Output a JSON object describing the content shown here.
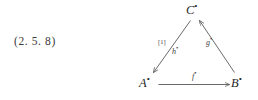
{
  "page": {
    "background_color": "#ffffff",
    "ink_color": "#2b2b2b"
  },
  "equation": {
    "number": "(2. 5. 8)"
  },
  "diagram": {
    "type": "commutative-triangle",
    "bullet_glyph": "•",
    "vertices": [
      {
        "id": "C",
        "label": "C",
        "bullet": "•",
        "x": 62,
        "y": 12
      },
      {
        "id": "A",
        "label": "A",
        "bullet": "•",
        "x": 16,
        "y": 85
      },
      {
        "id": "B",
        "label": "B",
        "bullet": "•",
        "x": 108,
        "y": 85
      }
    ],
    "edges": [
      {
        "id": "f",
        "label": "f",
        "bullet": "•",
        "from": "A",
        "to": "B",
        "style": "straight",
        "arrowhead": "to"
      },
      {
        "id": "g",
        "label": "g",
        "bullet": "•",
        "from": "B",
        "to": "C",
        "style": "straight",
        "arrowhead": "to"
      },
      {
        "id": "h",
        "label": "h",
        "bullet": "•",
        "from": "C",
        "to": "A",
        "style": "straight",
        "arrowhead": "to"
      }
    ],
    "annotations": [
      {
        "id": "bracket-one",
        "text": "[1]",
        "near_edge": "h"
      }
    ],
    "line_color": "#595959",
    "line_width": 0.9
  }
}
